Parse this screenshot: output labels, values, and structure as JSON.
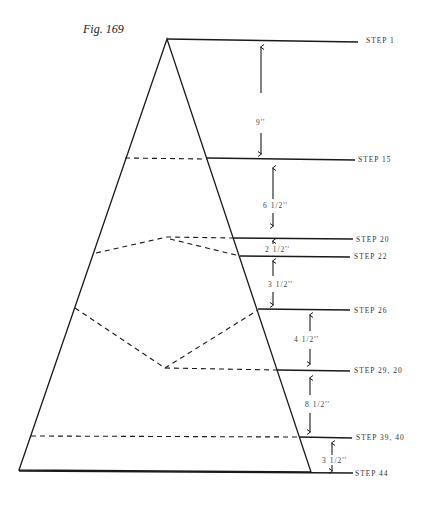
{
  "figure": {
    "title": "Fig. 169",
    "steps": [
      {
        "label": "STEP 1",
        "y": 40
      },
      {
        "label": "STEP 15",
        "y": 159
      },
      {
        "label": "STEP 20",
        "y": 239
      },
      {
        "label": "STEP 22",
        "y": 256
      },
      {
        "label": "STEP 26",
        "y": 310
      },
      {
        "label": "STEP 29, 20",
        "y": 370
      },
      {
        "label": "STEP 39, 40",
        "y": 437
      },
      {
        "label": "STEP 44",
        "y": 473
      }
    ],
    "dimensions": [
      {
        "label": "9''",
        "from": "STEP 1",
        "to": "STEP 15"
      },
      {
        "label": "6  1/2''",
        "from": "STEP 15",
        "to": "STEP 20"
      },
      {
        "label": "2 1/2''",
        "from": "STEP 20",
        "to": "STEP 22"
      },
      {
        "label": "3  1/2''",
        "from": "STEP 22",
        "to": "STEP 26"
      },
      {
        "label": "4  1/2''",
        "from": "STEP 26",
        "to": "STEP 29, 20"
      },
      {
        "label": "8  1/2''",
        "from": "STEP 29, 20",
        "to": "STEP 39, 40"
      },
      {
        "label": "3  1/2''",
        "from": "STEP 39, 40",
        "to": "STEP 44"
      }
    ],
    "colors": {
      "line": "#1a1a1a",
      "text": "#333333",
      "background": "#ffffff"
    }
  }
}
